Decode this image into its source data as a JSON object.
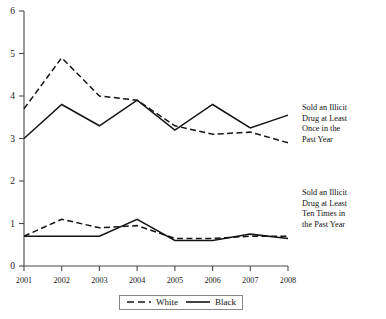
{
  "chart_data": {
    "type": "line",
    "title": "",
    "subtitle": "",
    "xlabel": "",
    "ylabel": "",
    "categories": [
      "2001",
      "2002",
      "2003",
      "2004",
      "2005",
      "2006",
      "2007",
      "2008"
    ],
    "x": [
      2001,
      2002,
      2003,
      2004,
      2005,
      2006,
      2007,
      2008
    ],
    "xlim": [
      2001,
      2008
    ],
    "ylim": [
      0,
      6
    ],
    "y_ticks": [
      "0",
      "1",
      "2",
      "3",
      "4",
      "5",
      "6"
    ],
    "y_tick_values": [
      0,
      1,
      2,
      3,
      4,
      5,
      6
    ],
    "grid": false,
    "legend_position": "bottom-center",
    "series": [
      {
        "name": "White",
        "style": "dashed",
        "group": "Sold an Illicit Drug at Least Once in the Past Year",
        "values": [
          3.7,
          4.9,
          4.0,
          3.9,
          3.3,
          3.1,
          3.15,
          2.9
        ]
      },
      {
        "name": "Black",
        "style": "solid",
        "group": "Sold an Illicit Drug at Least Once in the Past Year",
        "values": [
          3.0,
          3.8,
          3.3,
          3.9,
          3.2,
          3.8,
          3.25,
          3.55
        ]
      },
      {
        "name": "White",
        "style": "dashed",
        "group": "Sold an Illicit Drug at Least Ten Times in the Past Year",
        "values": [
          0.7,
          1.1,
          0.9,
          0.95,
          0.65,
          0.65,
          0.7,
          0.7
        ]
      },
      {
        "name": "Black",
        "style": "solid",
        "group": "Sold an Illicit Drug at Least Ten Times in the Past Year",
        "values": [
          0.7,
          0.7,
          0.7,
          1.1,
          0.6,
          0.6,
          0.75,
          0.65
        ]
      }
    ],
    "annotations": [
      {
        "id": "upper",
        "text": "Sold an Illicit Drug at Least Once in the Past Year",
        "lines": [
          "Sold an Illicit",
          "Drug at Least",
          "Once in the",
          "Past Year"
        ]
      },
      {
        "id": "lower",
        "text": "Sold an Illicit Drug at Least Ten Times in the Past Year",
        "lines": [
          "Sold an Illicit",
          "Drug at Least",
          "Ten Times in",
          "the Past Year"
        ]
      }
    ],
    "legend": [
      {
        "label": "White",
        "style": "dashed"
      },
      {
        "label": "Black",
        "style": "solid"
      }
    ],
    "colors": {
      "line": "#141414",
      "axis": "#4a4a4a",
      "background": "#ffffff"
    }
  },
  "axis": {
    "y": {
      "t0": "0",
      "t1": "1",
      "t2": "2",
      "t3": "3",
      "t4": "4",
      "t5": "5",
      "t6": "6"
    },
    "x": {
      "t0": "2001",
      "t1": "2002",
      "t2": "2003",
      "t3": "2004",
      "t4": "2005",
      "t5": "2006",
      "t6": "2007",
      "t7": "2008"
    }
  },
  "annotations": {
    "upper": {
      "l0": "Sold an Illicit",
      "l1": "Drug at Least",
      "l2": "Once in the",
      "l3": "Past Year"
    },
    "lower": {
      "l0": "Sold an Illicit",
      "l1": "Drug at Least",
      "l2": "Ten Times in",
      "l3": "the Past Year"
    }
  },
  "legend": {
    "white_label": "White",
    "black_label": "Black"
  }
}
